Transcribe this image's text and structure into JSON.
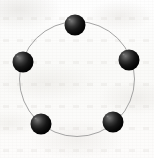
{
  "figure": {
    "description": "Five shaded dark spheres evenly spaced on a thin circular ring, drawn on scanned off-white paper.",
    "caption": "",
    "canvas": {
      "width": 154,
      "height": 158
    },
    "background": {
      "kind": "scanned-paper",
      "paper_color": "#fcfcfb",
      "mottle_color": "#e2dfdb",
      "bleed_through_color": "#c4c0ba"
    }
  },
  "chart_data": {
    "type": "scatter",
    "xlabel": "",
    "ylabel": "",
    "grid": false,
    "legend": "none",
    "ring": {
      "shape": "circle",
      "center_x": 77,
      "center_y": 79,
      "radius": 57.5,
      "stroke_color": "#9a9a9a",
      "stroke_width": 0.9,
      "fill": "none"
    },
    "node_style": {
      "shape": "sphere",
      "radius": 10.5,
      "base_color": "#111111",
      "highlight_color": "#6e6e6e",
      "shadow_color": "#000000",
      "highlight_offset_x": -0.32,
      "highlight_offset_y": -0.34
    },
    "categories": [
      "top",
      "upper-left",
      "upper-right",
      "lower-left",
      "lower-right"
    ],
    "points": [
      {
        "label": "top",
        "angle_deg": 90,
        "cx": 75,
        "cy": 25,
        "r": 10.5
      },
      {
        "label": "upper-left",
        "angle_deg": 162,
        "cx": 23,
        "cy": 62,
        "r": 10.5
      },
      {
        "label": "upper-right",
        "angle_deg": 18,
        "cx": 129,
        "cy": 60,
        "r": 10.5
      },
      {
        "label": "lower-left",
        "angle_deg": 234,
        "cx": 41,
        "cy": 124,
        "r": 10.5
      },
      {
        "label": "lower-right",
        "angle_deg": 306,
        "cx": 113,
        "cy": 122,
        "r": 10.5
      }
    ],
    "x": [
      75,
      23,
      129,
      41,
      113
    ],
    "y": [
      25,
      62,
      60,
      124,
      122
    ],
    "xlim": [
      0,
      154
    ],
    "ylim": [
      0,
      158
    ]
  }
}
